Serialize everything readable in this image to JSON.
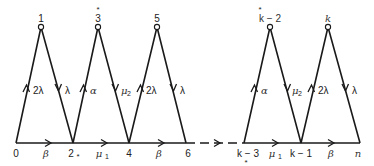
{
  "diagram": {
    "type": "state-transition",
    "baseline_nodes": [
      {
        "id": "n0",
        "label": "0",
        "x": 16
      },
      {
        "id": "n2",
        "label": "2",
        "marker": "*",
        "x": 73
      },
      {
        "id": "n4",
        "label": "4",
        "x": 129
      },
      {
        "id": "n6",
        "label": "6",
        "x": 186
      },
      {
        "id": "nk3",
        "label": "k − 3",
        "marker": "*",
        "x": 244
      },
      {
        "id": "nk1",
        "label": "k − 1",
        "x": 301
      },
      {
        "id": "nn",
        "label": "n",
        "x": 360
      }
    ],
    "top_nodes": [
      {
        "id": "n1",
        "label": "1",
        "x": 41
      },
      {
        "id": "n3",
        "label": "3",
        "marker": "*",
        "x": 98
      },
      {
        "id": "n5",
        "label": "5",
        "x": 157
      },
      {
        "id": "nk2",
        "label": "k − 2",
        "marker": "*",
        "x": 270
      },
      {
        "id": "nk",
        "label": "k",
        "x": 328
      }
    ],
    "baseline_edges": [
      {
        "from": "0",
        "to": "2*",
        "rate": "β"
      },
      {
        "from": "2*",
        "to": "4",
        "rate": "μ1"
      },
      {
        "from": "4",
        "to": "6",
        "rate": "β"
      },
      {
        "from": "6",
        "to": "k−3",
        "rate": "",
        "style": "dashed"
      },
      {
        "from": "k−3",
        "to": "k−1",
        "rate": "μ1"
      },
      {
        "from": "k−1",
        "to": "n",
        "rate": "β"
      }
    ],
    "peak_edges": [
      {
        "from": "0",
        "to": "1",
        "rate": "2λ"
      },
      {
        "from": "1",
        "to": "2*",
        "rate": "λ"
      },
      {
        "from": "2*",
        "to": "3*",
        "rate": "α"
      },
      {
        "from": "3*",
        "to": "4",
        "rate": "μ2"
      },
      {
        "from": "4",
        "to": "5",
        "rate": "2λ"
      },
      {
        "from": "5",
        "to": "6",
        "rate": "λ"
      },
      {
        "from": "k−3",
        "to": "k−2*",
        "rate": "α"
      },
      {
        "from": "k−2*",
        "to": "k−1",
        "rate": "μ2"
      },
      {
        "from": "k−1",
        "to": "k",
        "rate": "2λ"
      },
      {
        "from": "k",
        "to": "n",
        "rate": "λ"
      }
    ]
  },
  "labels": {
    "b0": "0",
    "b2": "2",
    "b2m": "*",
    "b4": "4",
    "b6": "6",
    "bk3": "k − 3",
    "bk3m": "*",
    "bk1": "k − 1",
    "bn": "n",
    "t1": "1",
    "t3": "3",
    "t3m": "*",
    "t5": "5",
    "tk2": "k − 2",
    "tk2m": "*",
    "tk": "k",
    "r_beta1": "β",
    "r_mu1a": "μ",
    "r_mu1a_sub": "1",
    "r_beta2": "β",
    "r_mu1b": "μ",
    "r_mu1b_sub": "1",
    "r_beta3": "β",
    "e01": "2λ",
    "e12": "λ",
    "e23": "α",
    "e34": "μ",
    "e34_sub": "2",
    "e45": "2λ",
    "e56": "λ",
    "ek3": "α",
    "ek2": "μ",
    "ek2_sub": "2",
    "ek1": "2λ",
    "ekn": "λ"
  }
}
